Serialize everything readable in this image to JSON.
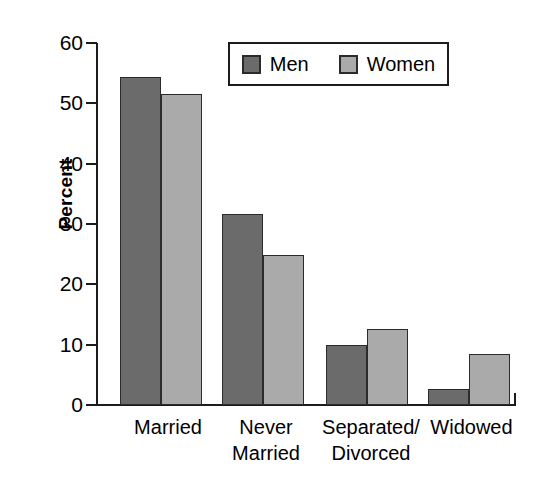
{
  "chart_data": {
    "type": "bar",
    "title": "",
    "subtitle": "",
    "xlabel": "",
    "ylabel": "Percent",
    "ylim": [
      0,
      60
    ],
    "yticks": [
      0,
      10,
      20,
      30,
      40,
      50,
      60
    ],
    "ytick_labels": [
      "0",
      "10",
      "20",
      "30",
      "40",
      "50",
      "60"
    ],
    "grid": false,
    "legend_position": "top-right",
    "categories": [
      "Married",
      "Never\nMarried",
      "Separated/\nDivorced",
      "Widowed"
    ],
    "series": [
      {
        "name": "Men",
        "color": "#6b6b6b",
        "values": [
          54.3,
          31.7,
          10.0,
          2.7
        ]
      },
      {
        "name": "Women",
        "color": "#aaaaaa",
        "values": [
          51.5,
          24.9,
          12.6,
          8.5
        ]
      }
    ]
  },
  "axis": {
    "y_title": "Percent",
    "y_ticks": [
      {
        "label": "60",
        "value": 60
      },
      {
        "label": "50",
        "value": 50
      },
      {
        "label": "40",
        "value": 40
      },
      {
        "label": "30",
        "value": 30
      },
      {
        "label": "20",
        "value": 20
      },
      {
        "label": "10",
        "value": 10
      },
      {
        "label": "0",
        "value": 0
      }
    ]
  },
  "categories": [
    {
      "label": "Married"
    },
    {
      "label": "Never\nMarried"
    },
    {
      "label": "Separated/\nDivorced"
    },
    {
      "label": "Widowed"
    }
  ],
  "legend": {
    "entries": [
      {
        "label": "Men",
        "color": "#6b6b6b"
      },
      {
        "label": "Women",
        "color": "#aaaaaa"
      }
    ]
  }
}
